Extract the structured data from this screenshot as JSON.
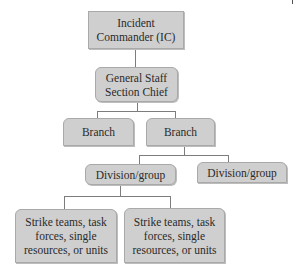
{
  "diagram": {
    "type": "org-chart",
    "colors": {
      "box_fill": "#cfcfcf",
      "box_border": "#a9a9a9",
      "connector": "#7d7d7d",
      "text": "#2a2a2a"
    },
    "nodes": {
      "ic": {
        "label": "Incident\nCommander (IC)",
        "level": 1
      },
      "general_staff": {
        "label": "General Staff\nSection Chief",
        "level": 2
      },
      "branch_left": {
        "label": "Branch",
        "level": 3
      },
      "branch_right": {
        "label": "Branch",
        "level": 3
      },
      "division_left": {
        "label": "Division/group",
        "level": 4
      },
      "division_right": {
        "label": "Division/group",
        "level": 4
      },
      "strike_left": {
        "label": "Strike teams, task\nforces, single\nresources, or units",
        "level": 5
      },
      "strike_right": {
        "label": "Strike teams, task\nforces, single\nresources, or units",
        "level": 5
      }
    },
    "edges": [
      [
        "ic",
        "general_staff"
      ],
      [
        "general_staff",
        "branch_left"
      ],
      [
        "general_staff",
        "branch_right"
      ],
      [
        "branch_right",
        "division_left"
      ],
      [
        "branch_right",
        "division_right"
      ],
      [
        "division_left",
        "strike_left"
      ],
      [
        "division_left",
        "strike_right"
      ]
    ]
  }
}
